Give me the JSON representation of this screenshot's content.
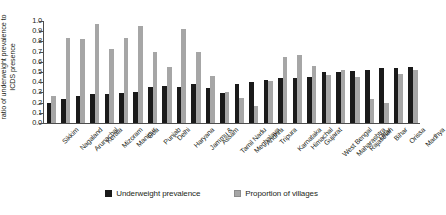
{
  "chart_data": {
    "type": "bar",
    "title": "",
    "xlabel": "",
    "ylabel": "ratio of underweight prevalence to ICDS presence",
    "ylim": [
      0.0,
      1.0
    ],
    "ytick_labels": [
      "1.0",
      "0.9",
      "0.8",
      "0.7",
      "0.6",
      "0.5",
      "0.4",
      "0.3",
      "0.2",
      "0.1",
      "0.0"
    ],
    "ytick_values": [
      1.0,
      0.9,
      0.8,
      0.7,
      0.6,
      0.5,
      0.4,
      0.3,
      0.2,
      0.1,
      0.0
    ],
    "grid": false,
    "legend_position": "bottom-center",
    "categories": [
      "Sikkim",
      "Nagaland",
      "Arunachal",
      "Kerala",
      "Mizoram",
      "Manipur",
      "Goa",
      "Punjab",
      "Delhi",
      "Haryana",
      "Jammu &",
      "Assam",
      "Tamil Nadu",
      "Meghalaya",
      "Andhra",
      "Tripura",
      "Karnataka",
      "Himachal",
      "Gujarat",
      "West Bengal",
      "Maharashtra",
      "Rajasthan",
      "Uttar",
      "Bihar",
      "Orissa",
      "Madhya"
    ],
    "series": [
      {
        "name": "Underweight prevalence",
        "color": "#1a1a1a",
        "values": [
          0.2,
          0.24,
          0.26,
          0.28,
          0.28,
          0.29,
          0.3,
          0.35,
          0.36,
          0.35,
          0.38,
          0.34,
          0.29,
          0.38,
          0.4,
          0.42,
          0.44,
          0.44,
          0.45,
          0.5,
          0.5,
          0.51,
          0.52,
          0.54,
          0.54,
          0.55
        ]
      },
      {
        "name": "Proportion of villages",
        "color": "#a6a6a6",
        "values": [
          0.26,
          0.83,
          0.82,
          0.97,
          0.73,
          0.83,
          0.95,
          0.7,
          0.55,
          0.92,
          0.7,
          0.46,
          0.3,
          0.25,
          0.17,
          0.41,
          0.65,
          0.67,
          0.56,
          0.47,
          0.52,
          0.45,
          0.24,
          0.2,
          0.48,
          0.52
        ]
      }
    ]
  },
  "legend": {
    "items": [
      {
        "label": "Underweight prevalence",
        "swatch": "dark"
      },
      {
        "label": "Proportion of villages",
        "swatch": "light"
      }
    ]
  }
}
